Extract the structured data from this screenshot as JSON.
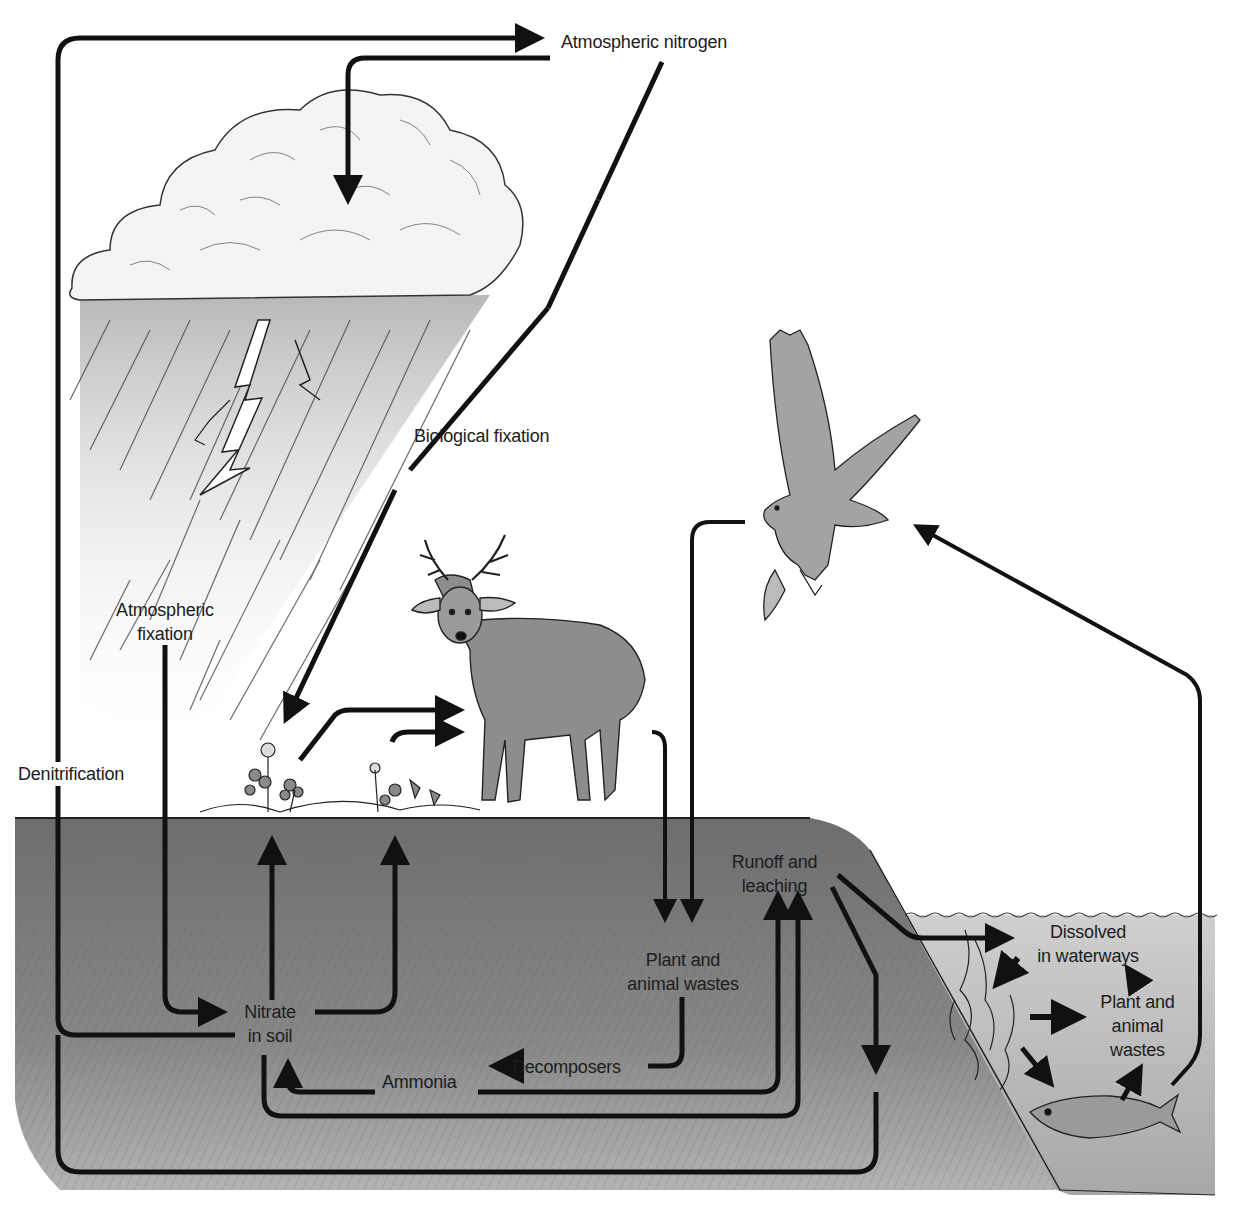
{
  "diagram": {
    "colors": {
      "background": "#ffffff",
      "soil": "#7d7d7d",
      "soil_light": "#a9a9a9",
      "water": "#b9b9b9",
      "arrow": "#111111",
      "text": "#1c1c1c",
      "cloud": "#f2f2f2",
      "rain": "#5a5a5a"
    },
    "labels": {
      "atmospheric_nitrogen": "Atmospheric nitrogen",
      "biological_fixation": "Biological fixation",
      "atmospheric_fixation_line1": "Atmospheric",
      "atmospheric_fixation_line2": "fixation",
      "denitrification": "Denitrification",
      "nitrate_line1": "Nitrate",
      "nitrate_line2": "in soil",
      "ammonia": "Ammonia",
      "decomposers": "Decomposers",
      "plant_animal_wastes_line1": "Plant and",
      "plant_animal_wastes_line2": "animal wastes",
      "runoff_line1": "Runoff and",
      "runoff_line2": "leaching",
      "dissolved_line1": "Dissolved",
      "dissolved_line2": "in waterways",
      "aquatic_wastes_line1": "Plant and",
      "aquatic_wastes_line2": "animal",
      "aquatic_wastes_line3": "wastes"
    },
    "illustrations": [
      "cloud",
      "rain",
      "lightning",
      "clover-plants",
      "deer",
      "osprey-with-fish",
      "seaweed",
      "fish",
      "water-surface"
    ],
    "flows": [
      {
        "from": "Nitrate in soil",
        "to": "Atmospheric nitrogen",
        "via": "Denitrification"
      },
      {
        "from": "Atmospheric nitrogen",
        "to": "Cloud",
        "via": "Atmospheric fixation"
      },
      {
        "from": "Atmospheric fixation",
        "to": "Nitrate in soil"
      },
      {
        "from": "Atmospheric nitrogen",
        "to": "Plants",
        "via": "Biological fixation"
      },
      {
        "from": "Plants",
        "to": "Deer"
      },
      {
        "from": "Nitrate in soil",
        "to": "Plants"
      },
      {
        "from": "Deer",
        "to": "Plant and animal wastes"
      },
      {
        "from": "Osprey",
        "to": "Plant and animal wastes"
      },
      {
        "from": "Plant and animal wastes",
        "to": "Decomposers"
      },
      {
        "from": "Decomposers",
        "to": "Ammonia"
      },
      {
        "from": "Ammonia",
        "to": "Nitrate in soil"
      },
      {
        "from": "Ammonia",
        "to": "Runoff and leaching"
      },
      {
        "from": "Nitrate in soil",
        "to": "Runoff and leaching"
      },
      {
        "from": "Runoff and leaching",
        "to": "Dissolved in waterways"
      },
      {
        "from": "Runoff and leaching",
        "to": "Denitrification loop"
      },
      {
        "from": "Dissolved in waterways",
        "to": "Seaweed"
      },
      {
        "from": "Seaweed",
        "to": "Plant and animal wastes (aquatic)"
      },
      {
        "from": "Seaweed",
        "to": "Fish"
      },
      {
        "from": "Fish",
        "to": "Plant and animal wastes (aquatic)"
      },
      {
        "from": "Plant and animal wastes (aquatic)",
        "to": "Dissolved in waterways"
      },
      {
        "from": "Fish",
        "to": "Osprey"
      }
    ]
  }
}
